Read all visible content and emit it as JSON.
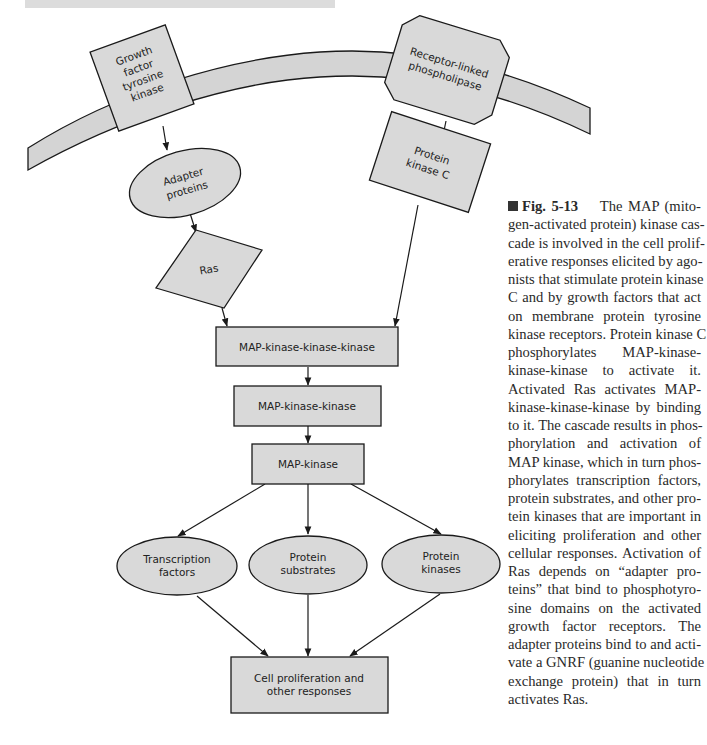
{
  "figure": {
    "number": "Fig. 5-13",
    "nodes": {
      "growth_factor_tyrosine_kinase": [
        "Growth",
        "factor",
        "tyrosine",
        "kinase"
      ],
      "receptor_linked_phospholipase": [
        "Receptor-linked",
        "phospholipase"
      ],
      "adapter_proteins": [
        "Adapter",
        "proteins"
      ],
      "protein_kinase_c": [
        "Protein",
        "kinase C"
      ],
      "ras": "Ras",
      "map_kkk": "MAP-kinase-kinase-kinase",
      "map_kk": "MAP-kinase-kinase",
      "map_k": "MAP-kinase",
      "transcription_factors": [
        "Transcription",
        "factors"
      ],
      "protein_substrates": [
        "Protein",
        "substrates"
      ],
      "protein_kinases": [
        "Protein",
        "kinases"
      ],
      "cell_proliferation": [
        "Cell proliferation and",
        "other responses"
      ]
    },
    "edges": [
      [
        "growth_factor_tyrosine_kinase",
        "adapter_proteins"
      ],
      [
        "adapter_proteins",
        "ras"
      ],
      [
        "ras",
        "map_kkk"
      ],
      [
        "receptor_linked_phospholipase",
        "protein_kinase_c"
      ],
      [
        "protein_kinase_c",
        "map_kkk"
      ],
      [
        "map_kkk",
        "map_kk"
      ],
      [
        "map_kk",
        "map_k"
      ],
      [
        "map_k",
        "transcription_factors"
      ],
      [
        "map_k",
        "protein_substrates"
      ],
      [
        "map_k",
        "protein_kinases"
      ],
      [
        "transcription_factors",
        "cell_proliferation"
      ],
      [
        "protein_substrates",
        "cell_proliferation"
      ],
      [
        "protein_kinases",
        "cell_proliferation"
      ]
    ],
    "colors": {
      "node_fill": "#d9d9d9",
      "membrane_fill": "#d4d4d4",
      "stroke": "#1a1a1a"
    }
  },
  "caption": {
    "label": "Fig. 5-13",
    "lines": [
      "The MAP (mito-",
      "gen-activated protein) kinase cas-",
      "cade is involved in the cell prolif-",
      "erative responses elicited by ago-",
      "nists that stimulate protein kinase",
      "C and by growth factors that act",
      "on membrane protein tyrosine",
      "kinase receptors. Protein kinase C",
      "phosphorylates MAP-kinase-",
      "kinase-kinase to activate it.",
      "Activated Ras activates MAP-",
      "kinase-kinase-kinase by binding",
      "to it. The cascade results in phos-",
      "phorylation and activation of",
      "MAP kinase, which in turn phos-",
      "phorylates transcription factors,",
      "protein substrates, and other pro-",
      "tein kinases that are important in",
      "eliciting proliferation and other",
      "cellular responses. Activation of",
      "Ras depends on “adapter pro-",
      "teins” that bind to phosphotyro-",
      "sine domains on the activated",
      "growth factor receptors. The",
      "adapter proteins bind to and acti-",
      "vate a GNRF (guanine nucleotide",
      "exchange protein) that in turn",
      "activates Ras."
    ]
  }
}
